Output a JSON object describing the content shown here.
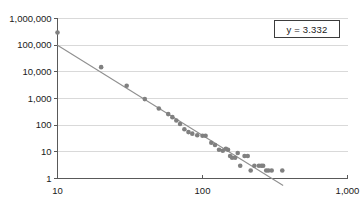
{
  "chart_data": {
    "type": "scatter",
    "title": "",
    "xlabel": "",
    "ylabel": "",
    "xscale": "log",
    "yscale": "log",
    "xlim": [
      10,
      1000
    ],
    "ylim": [
      1,
      1000000
    ],
    "grid": true,
    "grid_axis": "y",
    "legend": "none",
    "annotation": "y = 3.332",
    "colors": {
      "marker": "#808080",
      "trendline": "#909090",
      "gridline": "#d9d9d9",
      "axis": "#595959",
      "text": "#1a1a1a",
      "background": "#ffffff",
      "annotation_border": "#3c3c3c"
    },
    "xticks": [
      10,
      100,
      1000
    ],
    "xtick_labels": [
      "10",
      "100",
      "1,000"
    ],
    "yticks": [
      1,
      10,
      100,
      1000,
      10000,
      100000,
      1000000
    ],
    "ytick_labels": [
      "1",
      "10",
      "100",
      "1,000",
      "10,000",
      "100,000",
      "1,000,000"
    ],
    "series": [
      {
        "name": "observations",
        "marker": "circle",
        "points": [
          [
            10,
            300000
          ],
          [
            20,
            15000
          ],
          [
            30,
            3000
          ],
          [
            40,
            950
          ],
          [
            50,
            420
          ],
          [
            58,
            260
          ],
          [
            62,
            200
          ],
          [
            66,
            150
          ],
          [
            70,
            110
          ],
          [
            75,
            70
          ],
          [
            80,
            55
          ],
          [
            85,
            48
          ],
          [
            92,
            42
          ],
          [
            100,
            40
          ],
          [
            105,
            40
          ],
          [
            115,
            22
          ],
          [
            122,
            18
          ],
          [
            130,
            12
          ],
          [
            138,
            11
          ],
          [
            145,
            13
          ],
          [
            150,
            12
          ],
          [
            155,
            7
          ],
          [
            160,
            6
          ],
          [
            168,
            6
          ],
          [
            175,
            9
          ],
          [
            182,
            3
          ],
          [
            195,
            7
          ],
          [
            205,
            7
          ],
          [
            215,
            2
          ],
          [
            228,
            3
          ],
          [
            245,
            3
          ],
          [
            255,
            3
          ],
          [
            262,
            3
          ],
          [
            275,
            2
          ],
          [
            285,
            2
          ],
          [
            300,
            2
          ],
          [
            355,
            2
          ]
        ]
      }
    ],
    "trendline": {
      "type": "power-law",
      "exponent": -3.332,
      "x_start": 10,
      "y_start": 100000,
      "x_end": 360,
      "y_end": 0.55
    }
  }
}
